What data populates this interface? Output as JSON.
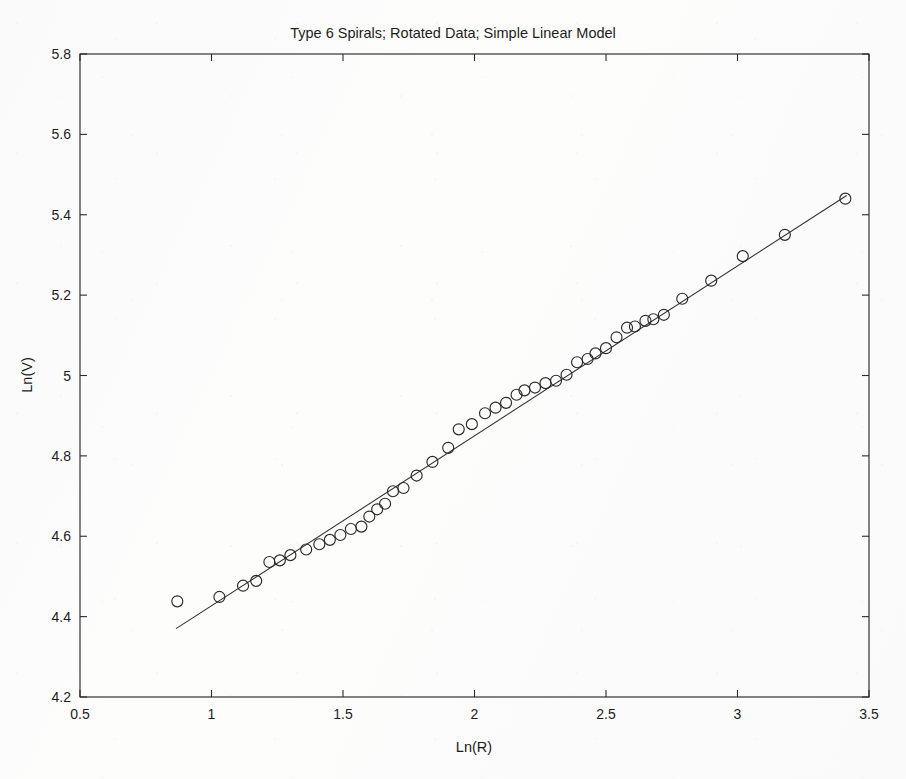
{
  "figure": {
    "background_color": "#fdfdfc",
    "ink_color": "#2b2b2b"
  },
  "chart_data": {
    "type": "scatter",
    "title": "Type 6 Spirals; Rotated Data; Simple Linear Model",
    "xlabel": "Ln(R)",
    "ylabel": "Ln(V)",
    "xlim": [
      0.5,
      3.5
    ],
    "ylim": [
      4.2,
      5.8
    ],
    "xticks": [
      0.5,
      1,
      1.5,
      2,
      2.5,
      3,
      3.5
    ],
    "xtick_labels": [
      "0.5",
      "1",
      "1.5",
      "2",
      "2.5",
      "3",
      "3.5"
    ],
    "yticks": [
      4.2,
      4.4,
      4.6,
      4.8,
      5,
      5.2,
      5.4,
      5.6,
      5.8
    ],
    "ytick_labels": [
      "4.2",
      "4.4",
      "4.6",
      "4.8",
      "5",
      "5.2",
      "5.4",
      "5.6",
      "5.8"
    ],
    "grid": false,
    "legend": null,
    "series": [
      {
        "name": "Rotated Data",
        "marker": "open-circle",
        "marker_size_px": 11,
        "color": "#2a2a2a",
        "x": [
          0.87,
          1.03,
          1.12,
          1.17,
          1.22,
          1.26,
          1.3,
          1.36,
          1.41,
          1.45,
          1.49,
          1.53,
          1.57,
          1.6,
          1.63,
          1.66,
          1.69,
          1.73,
          1.78,
          1.84,
          1.9,
          1.94,
          1.99,
          2.04,
          2.08,
          2.12,
          2.16,
          2.19,
          2.23,
          2.27,
          2.31,
          2.35,
          2.39,
          2.43,
          2.46,
          2.5,
          2.54,
          2.58,
          2.61,
          2.65,
          2.68,
          2.72,
          2.79,
          2.9,
          3.02,
          3.18,
          3.41
        ],
        "y": [
          4.438,
          4.449,
          4.477,
          4.489,
          4.536,
          4.54,
          4.553,
          4.567,
          4.58,
          4.591,
          4.603,
          4.618,
          4.624,
          4.649,
          4.667,
          4.681,
          4.712,
          4.72,
          4.751,
          4.785,
          4.82,
          4.866,
          4.879,
          4.906,
          4.92,
          4.932,
          4.952,
          4.963,
          4.97,
          4.981,
          4.987,
          5.002,
          5.033,
          5.041,
          5.055,
          5.068,
          5.095,
          5.119,
          5.122,
          5.136,
          5.14,
          5.151,
          5.191,
          5.236,
          5.297,
          5.35,
          5.44
        ]
      }
    ],
    "fit_line": {
      "name": "Simple Linear Model",
      "type": "line",
      "color": "#2f2f2f",
      "x_endpoints": [
        0.865,
        3.415
      ],
      "y_endpoints": [
        4.37,
        5.448
      ],
      "slope": 0.4227,
      "intercept": 4.0043
    }
  },
  "axes": {
    "title_label": "Type 6 Spirals; Rotated Data; Simple Linear Model",
    "x_axis_title": "Ln(R)",
    "y_axis_title": "Ln(V)"
  }
}
